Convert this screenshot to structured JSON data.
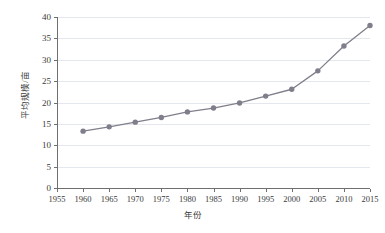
{
  "chart_data": {
    "type": "line",
    "title": "",
    "xlabel": "年份",
    "ylabel": "平均规模/亩",
    "xlim": [
      1955,
      2015
    ],
    "ylim": [
      0,
      40
    ],
    "xticks": [
      1955,
      1960,
      1965,
      1970,
      1975,
      1980,
      1985,
      1990,
      1995,
      2000,
      2005,
      2010,
      2015
    ],
    "yticks": [
      0,
      5,
      10,
      15,
      20,
      25,
      30,
      35,
      40
    ],
    "grid": "horizontal",
    "legend": "none",
    "marker": "circle",
    "series_color": "#7f7f8c",
    "x": [
      1960,
      1965,
      1970,
      1975,
      1980,
      1985,
      1990,
      1995,
      2000,
      2005,
      2010,
      2015
    ],
    "values": [
      13.3,
      14.3,
      15.4,
      16.5,
      17.8,
      18.7,
      19.9,
      21.5,
      23.1,
      27.4,
      33.2,
      38.0
    ],
    "series": [
      {
        "name": "平均规模/亩",
        "values": [
          13.3,
          14.3,
          15.4,
          16.5,
          17.8,
          18.7,
          19.9,
          21.5,
          23.1,
          27.4,
          33.2,
          38.0
        ]
      }
    ]
  },
  "axis": {
    "y_title": "平均规模/亩",
    "x_title": "年份",
    "y_tick_labels": [
      "0",
      "5",
      "10",
      "15",
      "20",
      "25",
      "30",
      "35",
      "40"
    ],
    "x_tick_labels": [
      "1955",
      "1960",
      "1965",
      "1970",
      "1975",
      "1980",
      "1985",
      "1990",
      "1995",
      "2000",
      "2005",
      "2010",
      "2015"
    ]
  },
  "colors": {
    "series": "#7f7f8c",
    "grid": "#e4e8ee",
    "axis": "#6f6f6f",
    "text": "#3a3a3a",
    "background": "#ffffff"
  }
}
